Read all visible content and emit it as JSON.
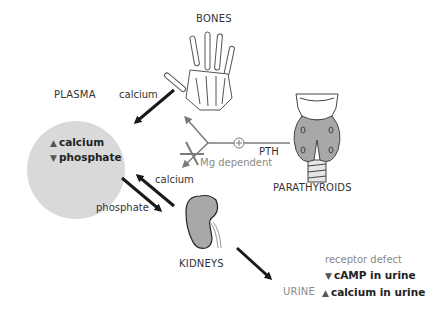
{
  "nodes": {
    "bones": {
      "label": "BONES",
      "icon": "hand-skeleton-icon"
    },
    "plasma": {
      "label": "PLASMA",
      "items": [
        {
          "arrow": "▲",
          "direction": "up",
          "text": "calcium"
        },
        {
          "arrow": "▼",
          "direction": "down",
          "text": "phosphate"
        }
      ]
    },
    "parathyroids": {
      "label": "PARATHYROIDS",
      "icon": "thyroid-gland-icon"
    },
    "kidneys": {
      "label": "KIDNEYS",
      "icon": "kidney-icon"
    },
    "urine": {
      "label": "URINE"
    }
  },
  "edges": {
    "bones_to_plasma": "calcium",
    "kidneys_to_plasma": "calcium",
    "plasma_to_kidneys": "phosphate",
    "pth": "PTH",
    "pth_stimulation_symbol": "+",
    "mg_dependent": "Mg dependent"
  },
  "urine_findings": {
    "header": "receptor defect",
    "items": [
      {
        "arrow": "▼",
        "direction": "down",
        "text": "cAMP in urine"
      },
      {
        "arrow": "▲",
        "direction": "up",
        "text": "calcium in urine"
      }
    ]
  },
  "colors": {
    "plasma_fill": "#d9d9d9",
    "arrow_dark": "#1a1a1a",
    "pth_line": "#7a7a7a",
    "muted_text": "#8a8a8a",
    "organ_fill": "#a8a8a8"
  }
}
